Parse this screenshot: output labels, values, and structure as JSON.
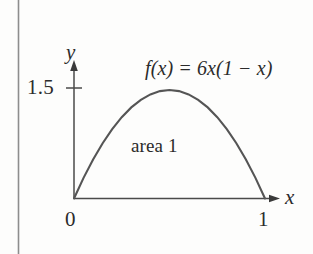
{
  "figure": {
    "border_line_color": "#8d8d8d",
    "axis_color": "#4a4a4a",
    "curve_color": "#555555",
    "text_color": "#2b2b2b",
    "background": "#fdfdfc",
    "labels": {
      "y_axis": "y",
      "x_axis": "x",
      "y_tick": "1.5",
      "origin": "0",
      "x_tick": "1",
      "area": "area 1",
      "formula": "f(x) = 6x(1 − x)"
    }
  },
  "chart_data": {
    "type": "line",
    "title": "",
    "subtitle": "",
    "xlabel": "x",
    "ylabel": "y",
    "xlim": [
      0,
      1.08
    ],
    "ylim": [
      0,
      1.72
    ],
    "grid": false,
    "legend": false,
    "annotations": [
      {
        "text": "f(x) = 6x(1 − x)",
        "x": 0.55,
        "y": 1.68
      },
      {
        "text": "area 1",
        "x": 0.47,
        "y": 0.72
      }
    ],
    "xticks": [
      0,
      1
    ],
    "xticklabels": [
      "0",
      "1"
    ],
    "yticks": [
      1.5
    ],
    "yticklabels": [
      "1.5"
    ],
    "series": [
      {
        "name": "f(x) = 6x(1 − x)",
        "function": "6x(1-x)",
        "x": [
          0,
          0.05,
          0.1,
          0.15,
          0.2,
          0.25,
          0.3,
          0.35,
          0.4,
          0.45,
          0.5,
          0.55,
          0.6,
          0.65,
          0.7,
          0.75,
          0.8,
          0.85,
          0.9,
          0.95,
          1
        ],
        "y": [
          0,
          0.285,
          0.54,
          0.765,
          0.96,
          1.125,
          1.26,
          1.365,
          1.44,
          1.485,
          1.5,
          1.485,
          1.44,
          1.365,
          1.26,
          1.125,
          0.96,
          0.765,
          0.54,
          0.285,
          0
        ],
        "peak": {
          "x": 0.5,
          "y": 1.5
        },
        "integral": 1
      }
    ]
  }
}
